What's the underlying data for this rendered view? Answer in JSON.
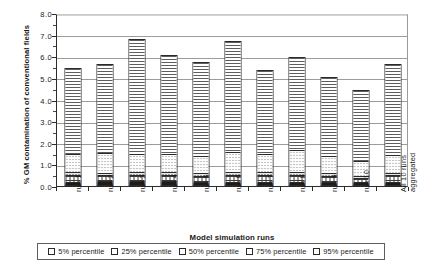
{
  "chart_data": {
    "type": "bar",
    "subtype": "stacked-vertical",
    "title": "",
    "xlabel": "Model simulation runs",
    "ylabel": "% GM contamination of conventional fields",
    "ylim": [
      0.0,
      8.0
    ],
    "ytick_step": 1.0,
    "ytick_labels": [
      "8.0",
      "7.0",
      "6.0",
      "5.0",
      "4.0",
      "3.0",
      "2.0",
      "1.0",
      "0.0"
    ],
    "ytick_values": [
      8.0,
      7.0,
      6.0,
      5.0,
      4.0,
      3.0,
      2.0,
      1.0,
      0.0
    ],
    "grid": "horizontal",
    "legend_position": "bottom",
    "categories": [
      "run 1",
      "run 2",
      "run 3",
      "run 4",
      "run 5",
      "run 6",
      "run 7",
      "run 8",
      "run 9",
      "run 10",
      "All 10 runs aggregated"
    ],
    "series": [
      {
        "name": "5% percentile",
        "pattern": "solid-black",
        "values": [
          0.1,
          0.12,
          0.12,
          0.12,
          0.1,
          0.1,
          0.1,
          0.1,
          0.1,
          0.08,
          0.1
        ]
      },
      {
        "name": "25% percentile",
        "pattern": "grid-hatch",
        "values": [
          0.3,
          0.3,
          0.3,
          0.3,
          0.28,
          0.3,
          0.3,
          0.3,
          0.28,
          0.22,
          0.3
        ]
      },
      {
        "name": "50% percentile",
        "pattern": "dense-dots",
        "values": [
          0.15,
          0.12,
          0.12,
          0.12,
          0.12,
          0.18,
          0.15,
          0.18,
          0.12,
          0.1,
          0.12
        ]
      },
      {
        "name": "75% percentile",
        "pattern": "light-dots",
        "values": [
          0.85,
          0.9,
          0.85,
          0.85,
          0.82,
          0.9,
          0.85,
          1.0,
          0.8,
          0.7,
          0.85
        ]
      },
      {
        "name": "95% percentile",
        "pattern": "horizontal-lines",
        "values": [
          4.05,
          4.21,
          5.41,
          4.66,
          4.43,
          5.22,
          3.95,
          4.37,
          3.75,
          3.35,
          4.28
        ]
      }
    ],
    "totals": [
      5.45,
      5.65,
      6.8,
      6.05,
      5.75,
      6.7,
      5.35,
      5.95,
      5.05,
      4.45,
      5.65
    ]
  },
  "legend": {
    "items": [
      {
        "label": "5% percentile"
      },
      {
        "label": "25% percentile"
      },
      {
        "label": "50% percentile"
      },
      {
        "label": "75% percentile"
      },
      {
        "label": "95% percentile"
      }
    ]
  }
}
